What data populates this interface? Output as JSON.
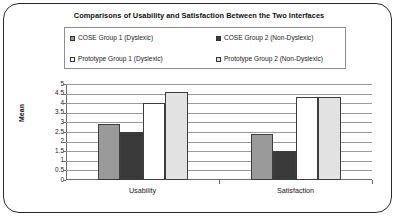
{
  "chart_data": {
    "type": "bar",
    "title": "Comparisons of Usability and Satisfaction Between the Two Interfaces",
    "xlabel": "",
    "ylabel": "Mean",
    "categories": [
      "Usability",
      "Satisfaction"
    ],
    "series": [
      {
        "name": "COSE Group 1 (Dyslexic)",
        "values": [
          2.9,
          2.4
        ],
        "color": "#9a9a9a"
      },
      {
        "name": "COSE Group 2 (Non-Dyslexic)",
        "values": [
          2.5,
          1.5
        ],
        "color": "#3a3a3a"
      },
      {
        "name": "Prototype Group 1 (Dyslexic)",
        "values": [
          4.0,
          4.3
        ],
        "color": "#ffffff"
      },
      {
        "name": "Prototype Group 2 (Non-Dyslexic)",
        "values": [
          4.6,
          4.3
        ],
        "color": "#e2e2e2"
      }
    ],
    "ylim": [
      0,
      5
    ],
    "yticks": [
      "5",
      "4.5",
      "4",
      "3.5",
      "3",
      "2.5",
      "2",
      "1.5",
      "1",
      "0.5",
      "0"
    ],
    "ytick_values": [
      5,
      4.5,
      4,
      3.5,
      3,
      2.5,
      2,
      1.5,
      1,
      0.5,
      0
    ],
    "grid": true,
    "legend_position": "top"
  },
  "legend": {
    "entries": [
      {
        "label": "COSE Group 1 (Dyslexic)",
        "swatch": "#9a9a9a"
      },
      {
        "label": "COSE Group 2 (Non-Dyslexic)",
        "swatch": "#3a3a3a"
      },
      {
        "label": "Prototype Group 1 (Dyslexic)",
        "swatch": "#ffffff"
      },
      {
        "label": "Prototype Group 2 (Non-Dyslexic)",
        "swatch": "#e2e2e2"
      }
    ]
  },
  "colors": {
    "frame": "#2b2b2b",
    "gridline": "#9a9a9a",
    "axis": "#6b6b6b",
    "text": "#1a1a1a"
  }
}
